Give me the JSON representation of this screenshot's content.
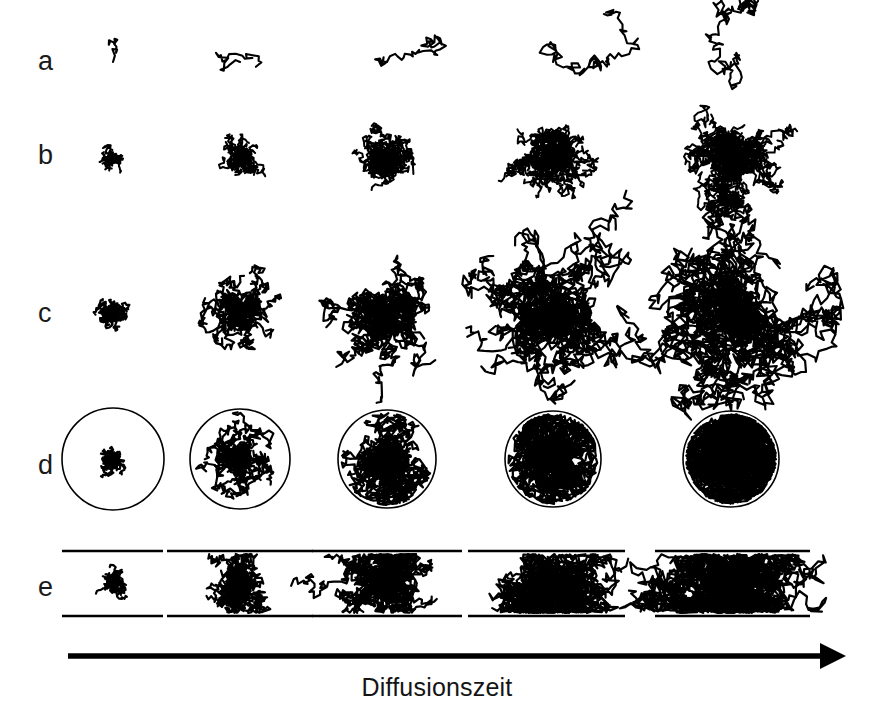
{
  "figure": {
    "type": "scientific-diagram",
    "background_color": "#ffffff",
    "ink_color": "#000000",
    "row_labels": [
      "a",
      "b",
      "c",
      "d",
      "e"
    ],
    "column_count": 5
  },
  "axis": {
    "caption": "Diffusionszeit",
    "arrow_direction": "left-to-right",
    "arrow_x_start": 68,
    "arrow_x_end": 846,
    "arrow_y": 656
  },
  "rows": [
    {
      "id": "a",
      "label": "a",
      "label_x": 38,
      "label_y": 48,
      "description": "single random-walk trajectory",
      "center_y": 62,
      "panels": [
        {
          "column": 1,
          "center_x": 113,
          "steps": 12,
          "step_len": 5.0,
          "confinement": "none"
        },
        {
          "column": 2,
          "center_x": 240,
          "steps": 26,
          "step_len": 5.2,
          "confinement": "none"
        },
        {
          "column": 3,
          "center_x": 387,
          "steps": 45,
          "step_len": 5.4,
          "confinement": "none"
        },
        {
          "column": 4,
          "center_x": 553,
          "steps": 80,
          "step_len": 5.6,
          "confinement": "none"
        },
        {
          "column": 5,
          "center_x": 731,
          "steps": 140,
          "step_len": 5.8,
          "confinement": "none"
        }
      ]
    },
    {
      "id": "b",
      "label": "b",
      "label_x": 38,
      "label_y": 142,
      "description": "ensemble of trajectories, free diffusion",
      "center_y": 158,
      "panels": [
        {
          "column": 1,
          "center_x": 113,
          "walkers": 26,
          "steps": 14,
          "step_len": 2.0,
          "confinement": "none"
        },
        {
          "column": 2,
          "center_x": 240,
          "walkers": 30,
          "steps": 30,
          "step_len": 2.6,
          "confinement": "none"
        },
        {
          "column": 3,
          "center_x": 387,
          "walkers": 32,
          "steps": 46,
          "step_len": 3.0,
          "confinement": "none"
        },
        {
          "column": 4,
          "center_x": 553,
          "walkers": 34,
          "steps": 62,
          "step_len": 3.4,
          "confinement": "none"
        },
        {
          "column": 5,
          "center_x": 731,
          "walkers": 36,
          "steps": 80,
          "step_len": 3.8,
          "confinement": "none"
        }
      ]
    },
    {
      "id": "c",
      "label": "c",
      "label_x": 38,
      "label_y": 300,
      "description": "ensemble of trajectories, free diffusion, longer steps",
      "center_y": 315,
      "panels": [
        {
          "column": 1,
          "center_x": 113,
          "walkers": 26,
          "steps": 18,
          "step_len": 2.4,
          "confinement": "none"
        },
        {
          "column": 2,
          "center_x": 240,
          "walkers": 30,
          "steps": 34,
          "step_len": 4.2,
          "confinement": "none"
        },
        {
          "column": 3,
          "center_x": 387,
          "walkers": 32,
          "steps": 50,
          "step_len": 5.2,
          "confinement": "none"
        },
        {
          "column": 4,
          "center_x": 553,
          "walkers": 34,
          "steps": 66,
          "step_len": 6.4,
          "confinement": "none"
        },
        {
          "column": 5,
          "center_x": 731,
          "walkers": 36,
          "steps": 84,
          "step_len": 7.4,
          "confinement": "none"
        }
      ]
    },
    {
      "id": "d",
      "label": "d",
      "label_x": 38,
      "label_y": 452,
      "description": "diffusion confined inside a circular boundary",
      "center_y": 459,
      "boundary_shape": "circle",
      "panels": [
        {
          "column": 1,
          "center_x": 113,
          "walkers": 26,
          "steps": 18,
          "step_len": 2.4,
          "confinement": "circle",
          "radius": 51
        },
        {
          "column": 2,
          "center_x": 240,
          "walkers": 30,
          "steps": 34,
          "step_len": 4.2,
          "confinement": "circle",
          "radius": 50
        },
        {
          "column": 3,
          "center_x": 387,
          "walkers": 32,
          "steps": 50,
          "step_len": 5.2,
          "confinement": "circle",
          "radius": 49
        },
        {
          "column": 4,
          "center_x": 553,
          "walkers": 34,
          "steps": 66,
          "step_len": 6.4,
          "confinement": "circle",
          "radius": 48
        },
        {
          "column": 5,
          "center_x": 731,
          "walkers": 36,
          "steps": 84,
          "step_len": 7.4,
          "confinement": "circle",
          "radius": 48
        }
      ]
    },
    {
      "id": "e",
      "label": "e",
      "label_x": 38,
      "label_y": 574,
      "description": "diffusion confined between two parallel plates",
      "center_y": 583,
      "boundary_shape": "parallel-lines",
      "plate_top_y": 551,
      "plate_bottom_y": 616,
      "panels": [
        {
          "column": 1,
          "center_x": 113,
          "walkers": 26,
          "steps": 18,
          "step_len": 2.4,
          "confinement": "slab",
          "half_gap": 32,
          "plate_x1": 62,
          "plate_x2": 163
        },
        {
          "column": 2,
          "center_x": 240,
          "walkers": 30,
          "steps": 34,
          "step_len": 4.2,
          "confinement": "slab",
          "half_gap": 32,
          "plate_x1": 167,
          "plate_x2": 313
        },
        {
          "column": 3,
          "center_x": 387,
          "walkers": 32,
          "steps": 50,
          "step_len": 5.2,
          "confinement": "slab",
          "half_gap": 32,
          "plate_x1": 312,
          "plate_x2": 462
        },
        {
          "column": 4,
          "center_x": 553,
          "walkers": 34,
          "steps": 66,
          "step_len": 6.4,
          "confinement": "slab",
          "half_gap": 32,
          "plate_x1": 468,
          "plate_x2": 625
        },
        {
          "column": 5,
          "center_x": 731,
          "walkers": 36,
          "steps": 84,
          "step_len": 7.4,
          "confinement": "slab",
          "half_gap": 32,
          "plate_x1": 655,
          "plate_x2": 810
        }
      ]
    }
  ],
  "chart_data": {
    "type": "scatter",
    "title": "",
    "xlabel": "Diffusionszeit",
    "ylabel": "",
    "categories": [
      "a",
      "b",
      "c",
      "d",
      "e"
    ],
    "series": [
      {
        "name": "a - single trajectory (free)",
        "values": [
          12,
          26,
          45,
          80,
          140
        ]
      },
      {
        "name": "b - ensemble (free, short step)",
        "values": [
          14,
          30,
          46,
          62,
          80
        ]
      },
      {
        "name": "c - ensemble (free, long step)",
        "values": [
          18,
          34,
          50,
          66,
          84
        ]
      },
      {
        "name": "d - ensemble (circular confinement)",
        "values": [
          18,
          34,
          50,
          66,
          84
        ]
      },
      {
        "name": "e - ensemble (slab confinement)",
        "values": [
          18,
          34,
          50,
          66,
          84
        ]
      }
    ],
    "x": [
      1,
      2,
      3,
      4,
      5
    ],
    "grid": false,
    "legend": "none",
    "annotations": [
      "Diffusionszeit"
    ]
  }
}
